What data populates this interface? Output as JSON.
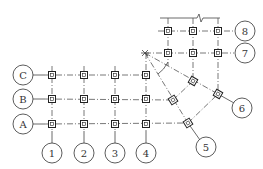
{
  "diagram": {
    "type": "structural axis grid plan",
    "row_axes": [
      {
        "label": "C",
        "y": 75
      },
      {
        "label": "B",
        "y": 99
      },
      {
        "label": "A",
        "y": 124
      }
    ],
    "column_axes": [
      {
        "label": "1",
        "x": 52
      },
      {
        "label": "2",
        "x": 84
      },
      {
        "label": "3",
        "x": 115
      },
      {
        "label": "4",
        "x": 146
      }
    ],
    "radial_axes": [
      {
        "label": "5",
        "bubble": [
          206,
          147
        ]
      },
      {
        "label": "6",
        "bubble": [
          242,
          108
        ]
      }
    ],
    "upper_row_axes": [
      {
        "label": "7",
        "y": 53
      },
      {
        "label": "8",
        "y": 31
      }
    ],
    "upper_columns_x": [
      168,
      193,
      218
    ],
    "pivot_point": [
      145,
      53
    ],
    "break_line": {
      "y": 18,
      "x_start": 160,
      "x_end": 220,
      "zigzag_x": 200
    },
    "colors": {
      "line": "#444444",
      "column": "#222222",
      "background": "#ffffff"
    }
  }
}
